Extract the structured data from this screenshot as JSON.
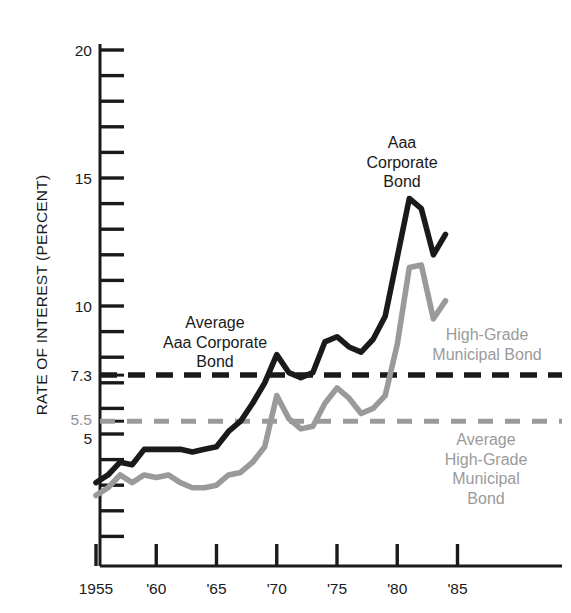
{
  "chart_data": {
    "type": "line",
    "title": "",
    "xlabel": "",
    "ylabel": "RATE OF INTEREST (PERCENT)",
    "xlim": [
      1954.3,
      1987.0
    ],
    "ylim": [
      0.7,
      20.9
    ],
    "grid": false,
    "legend_position": "inline-annotations",
    "y_ticks_labeled": [
      "20",
      "15",
      "10",
      "7.3",
      "5.5",
      "5"
    ],
    "y_tick_values": [
      20,
      15,
      10,
      7.3,
      5.5,
      5
    ],
    "y_minor_tick_values": [
      1,
      2,
      3,
      4,
      5,
      6,
      7,
      8,
      9,
      10,
      11,
      12,
      13,
      14,
      15,
      16,
      17,
      18,
      19,
      20
    ],
    "x_ticks": [
      "1955",
      "'60",
      "'65",
      "'70",
      "'75",
      "'80",
      "'85"
    ],
    "x_tick_values": [
      1955,
      1960,
      1965,
      1970,
      1975,
      1980,
      1985
    ],
    "series": [
      {
        "name": "Aaa Corporate Bond",
        "color": "#1a1a1a",
        "style": "solid",
        "x": [
          1955,
          1956,
          1957,
          1958,
          1959,
          1960,
          1961,
          1962,
          1963,
          1964,
          1965,
          1966,
          1967,
          1968,
          1969,
          1970,
          1971,
          1972,
          1973,
          1974,
          1975,
          1976,
          1977,
          1978,
          1979,
          1980,
          1981,
          1982,
          1983,
          1984
        ],
        "values": [
          3.1,
          3.4,
          3.9,
          3.8,
          4.4,
          4.4,
          4.4,
          4.4,
          4.3,
          4.4,
          4.5,
          5.1,
          5.5,
          6.2,
          7.0,
          8.1,
          7.4,
          7.2,
          7.4,
          8.6,
          8.8,
          8.4,
          8.2,
          8.7,
          9.6,
          11.9,
          14.2,
          13.8,
          12.0,
          12.8
        ]
      },
      {
        "name": "High-Grade Municipal Bond",
        "color": "#9a9a9a",
        "style": "solid",
        "x": [
          1955,
          1956,
          1957,
          1958,
          1959,
          1960,
          1961,
          1962,
          1963,
          1964,
          1965,
          1966,
          1967,
          1968,
          1969,
          1970,
          1971,
          1972,
          1973,
          1974,
          1975,
          1976,
          1977,
          1978,
          1979,
          1980,
          1981,
          1982,
          1983,
          1984
        ],
        "values": [
          2.6,
          2.9,
          3.4,
          3.1,
          3.4,
          3.3,
          3.4,
          3.1,
          2.9,
          2.9,
          3.0,
          3.4,
          3.5,
          3.9,
          4.5,
          6.5,
          5.6,
          5.2,
          5.3,
          6.2,
          6.8,
          6.4,
          5.8,
          6.0,
          6.5,
          8.5,
          11.5,
          11.6,
          9.5,
          10.2
        ]
      }
    ],
    "reference_lines": [
      {
        "name": "Average Aaa Corporate Bond",
        "value": 7.3,
        "color": "#1a1a1a",
        "style": "dashed",
        "label": "Average\nAaa Corporate\nBond",
        "label_right": ""
      },
      {
        "name": "Average High-Grade Municipal Bond",
        "value": 5.5,
        "color": "#9a9a9a",
        "style": "dashed",
        "label": "",
        "label_right": "Average\nHigh-Grade\nMunicipal\nBond"
      }
    ],
    "annotations": [
      {
        "id": "aaa-corporate-bond-label",
        "text": "Aaa\nCorporate\nBond",
        "color": "#1a1a1a",
        "x_px": 402,
        "y_px": 133
      },
      {
        "id": "high-grade-municipal-bond-label",
        "text": "High-Grade\nMunicipal Bond",
        "color": "#9a9a9a",
        "x_px": 487,
        "y_px": 325
      },
      {
        "id": "average-aaa-corporate-bond-label",
        "text": "Average\nAaa Corporate\nBond",
        "color": "#1a1a1a",
        "x_px": 215,
        "y_px": 313
      },
      {
        "id": "average-high-grade-municipal-bond-label",
        "text": "Average\nHigh-Grade\nMunicipal\nBond",
        "color": "#9a9a9a",
        "x_px": 486,
        "y_px": 430
      }
    ]
  },
  "axis": {
    "y_title": "RATE OF INTEREST (PERCENT)"
  },
  "annotations": {
    "aaa_corporate_bond": "Aaa\nCorporate\nBond",
    "high_grade_municipal_bond": "High-Grade\nMunicipal Bond",
    "average_aaa_corporate_bond": "Average\nAaa Corporate\nBond",
    "average_high_grade_municipal_bond": "Average\nHigh-Grade\nMunicipal\nBond"
  },
  "colors": {
    "corporate": "#1a1a1a",
    "municipal": "#9a9a9a",
    "background": "#ffffff"
  }
}
